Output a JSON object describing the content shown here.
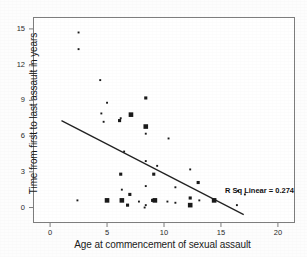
{
  "chart_data": {
    "type": "scatter",
    "title": "",
    "xlabel": "Age at commencement of sexual assault",
    "ylabel": "Time from first to last assault in years",
    "xlim": [
      -1.5,
      21.5
    ],
    "ylim": [
      -1.3,
      16.0
    ],
    "xticks": [
      0,
      5,
      10,
      15,
      20
    ],
    "yticks": [
      0,
      3,
      6,
      9,
      12,
      15
    ],
    "xtick_labels": [
      "0",
      "5",
      "10",
      "15",
      "20"
    ],
    "ytick_labels": [
      "0",
      "3",
      "6",
      "9",
      "12",
      "15"
    ],
    "grid": false,
    "legend": null,
    "annotations": [
      {
        "text": "R Sq Linear = 0.274",
        "x": 16.0,
        "y": 1.8
      }
    ],
    "fit_line": {
      "type": "linear",
      "r_squared": 0.274,
      "x_start": 1.0,
      "y_start": 7.3,
      "x_end": 17.0,
      "y_end": -0.6
    },
    "marker": "square",
    "marker_note": "Marker size is proportional to the number of overlapping cases at that coordinate.",
    "points": [
      {
        "x": 2.5,
        "y": 14.7,
        "size": 1
      },
      {
        "x": 2.5,
        "y": 13.3,
        "size": 1
      },
      {
        "x": 4.4,
        "y": 10.7,
        "size": 1
      },
      {
        "x": 8.4,
        "y": 9.2,
        "size": 2
      },
      {
        "x": 5.0,
        "y": 8.8,
        "size": 1
      },
      {
        "x": 4.5,
        "y": 7.9,
        "size": 1
      },
      {
        "x": 7.1,
        "y": 7.8,
        "size": 3
      },
      {
        "x": 6.2,
        "y": 7.5,
        "size": 1
      },
      {
        "x": 6.1,
        "y": 7.3,
        "size": 2
      },
      {
        "x": 4.7,
        "y": 7.2,
        "size": 1
      },
      {
        "x": 8.4,
        "y": 6.8,
        "size": 3
      },
      {
        "x": 8.4,
        "y": 6.2,
        "size": 1
      },
      {
        "x": 10.4,
        "y": 5.8,
        "size": 1
      },
      {
        "x": 6.5,
        "y": 4.7,
        "size": 1
      },
      {
        "x": 8.4,
        "y": 3.9,
        "size": 1
      },
      {
        "x": 9.4,
        "y": 3.5,
        "size": 1
      },
      {
        "x": 12.3,
        "y": 3.2,
        "size": 1
      },
      {
        "x": 6.2,
        "y": 2.8,
        "size": 2
      },
      {
        "x": 9.1,
        "y": 2.8,
        "size": 2
      },
      {
        "x": 13.0,
        "y": 2.1,
        "size": 2
      },
      {
        "x": 8.4,
        "y": 1.8,
        "size": 1
      },
      {
        "x": 11.0,
        "y": 1.7,
        "size": 1
      },
      {
        "x": 6.3,
        "y": 1.5,
        "size": 1
      },
      {
        "x": 16.5,
        "y": 1.4,
        "size": 1
      },
      {
        "x": 17.1,
        "y": 1.1,
        "size": 1
      },
      {
        "x": 7.0,
        "y": 1.1,
        "size": 2
      },
      {
        "x": 2.4,
        "y": 0.6,
        "size": 1
      },
      {
        "x": 5.0,
        "y": 0.6,
        "size": 3
      },
      {
        "x": 6.3,
        "y": 0.6,
        "size": 3
      },
      {
        "x": 7.8,
        "y": 0.5,
        "size": 1
      },
      {
        "x": 9.0,
        "y": 0.6,
        "size": 2
      },
      {
        "x": 9.2,
        "y": 0.6,
        "size": 3
      },
      {
        "x": 10.3,
        "y": 0.5,
        "size": 1
      },
      {
        "x": 11.0,
        "y": 0.4,
        "size": 1
      },
      {
        "x": 12.3,
        "y": 0.8,
        "size": 2
      },
      {
        "x": 13.1,
        "y": 0.6,
        "size": 1
      },
      {
        "x": 14.4,
        "y": 0.6,
        "size": 3
      },
      {
        "x": 6.8,
        "y": 0.2,
        "size": 2
      },
      {
        "x": 8.4,
        "y": 0.2,
        "size": 1
      },
      {
        "x": 12.3,
        "y": 0.2,
        "size": 3
      },
      {
        "x": 16.4,
        "y": 0.2,
        "size": 1
      },
      {
        "x": 8.3,
        "y": 0.0,
        "size": 1
      }
    ]
  },
  "colors": {
    "marker": "#1a1a1a",
    "line": "#222222",
    "frame": "#7d7d7d",
    "text": "#1b1b1b",
    "background": "#ffffff"
  }
}
